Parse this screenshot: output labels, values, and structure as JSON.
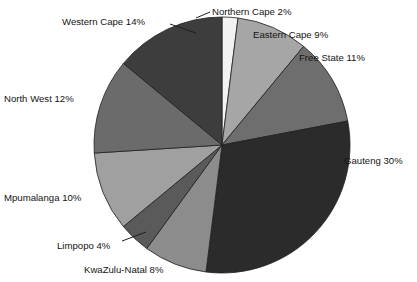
{
  "chart_data": {
    "type": "pie",
    "title": "",
    "xlabel": "",
    "ylabel": "",
    "units": "percent",
    "total": 100,
    "start_angle_deg": 0,
    "direction": "clockwise",
    "legend": "none",
    "labels_position": "outside-with-leader-lines",
    "categories": [
      "Northern Cape",
      "Eastern Cape",
      "Free State",
      "Gauteng",
      "KwaZulu-Natal",
      "Limpopo",
      "Mpumalanga",
      "North West",
      "Western Cape"
    ],
    "values": [
      2,
      9,
      11,
      30,
      8,
      4,
      10,
      12,
      14
    ],
    "colors": [
      "#f2f2f2",
      "#a6a6a6",
      "#6e6e6e",
      "#2b2b2b",
      "#8c8c8c",
      "#5a5a5a",
      "#a0a0a0",
      "#6b6b6b",
      "#3d3d3d"
    ],
    "slices": [
      {
        "label": "Northern Cape",
        "value": 2,
        "text": "Northern Cape 2%",
        "color": "#f2f2f2"
      },
      {
        "label": "Eastern Cape",
        "value": 9,
        "text": "Eastern Cape 9%",
        "color": "#a6a6a6"
      },
      {
        "label": "Free State",
        "value": 11,
        "text": "Free State 11%",
        "color": "#6e6e6e"
      },
      {
        "label": "Gauteng",
        "value": 30,
        "text": "Gauteng 30%",
        "color": "#2b2b2b"
      },
      {
        "label": "KwaZulu-Natal",
        "value": 8,
        "text": "KwaZulu-Natal 8%",
        "color": "#8c8c8c"
      },
      {
        "label": "Limpopo",
        "value": 4,
        "text": "Limpopo 4%",
        "color": "#5a5a5a"
      },
      {
        "label": "Mpumalanga",
        "value": 10,
        "text": "Mpumalanga 10%",
        "color": "#a0a0a0"
      },
      {
        "label": "North West",
        "value": 12,
        "text": "North West 12%",
        "color": "#6b6b6b"
      },
      {
        "label": "Western Cape",
        "value": 14,
        "text": "Western Cape 14%",
        "color": "#3d3d3d"
      }
    ]
  },
  "geometry": {
    "center_x": 222,
    "center_y": 145,
    "radius": 128
  },
  "style": {
    "background": "#ffffff",
    "text_color": "#141414",
    "outline_color": "#1f1f1f"
  }
}
